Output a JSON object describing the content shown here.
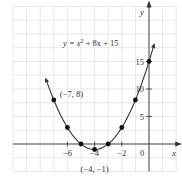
{
  "chart_data": {
    "type": "line",
    "title": "",
    "equation": "y = x² + 8x + 15",
    "equation_parts": {
      "lhs": "y = x",
      "exp": "2",
      "rhs": " + 8x + 15"
    },
    "xlabel": "x",
    "ylabel": "y",
    "xlim": [
      -10,
      2
    ],
    "ylim": [
      -5,
      25
    ],
    "grid": true,
    "x_ticks": [
      {
        "value": -6,
        "label": "−6"
      },
      {
        "value": -4,
        "label": "−4"
      },
      {
        "value": -2,
        "label": "−2"
      },
      {
        "value": 0,
        "label": "0"
      }
    ],
    "y_ticks": [
      {
        "value": 5,
        "label": "5"
      },
      {
        "value": 10,
        "label": "10"
      },
      {
        "value": 15,
        "label": "15"
      }
    ],
    "points": [
      {
        "x": -7,
        "y": 8
      },
      {
        "x": -6,
        "y": 3
      },
      {
        "x": -5,
        "y": 0
      },
      {
        "x": -4,
        "y": -1
      },
      {
        "x": -3,
        "y": 0
      },
      {
        "x": -2,
        "y": 3
      },
      {
        "x": -1,
        "y": 8
      },
      {
        "x": 0,
        "y": 15
      }
    ],
    "annotations": [
      {
        "x": -7,
        "y": 8,
        "text": "(−7, 8)"
      },
      {
        "x": -4,
        "y": -1,
        "text": "(−4, −1)"
      }
    ],
    "curve_domain": [
      -7.5,
      0.3
    ]
  }
}
